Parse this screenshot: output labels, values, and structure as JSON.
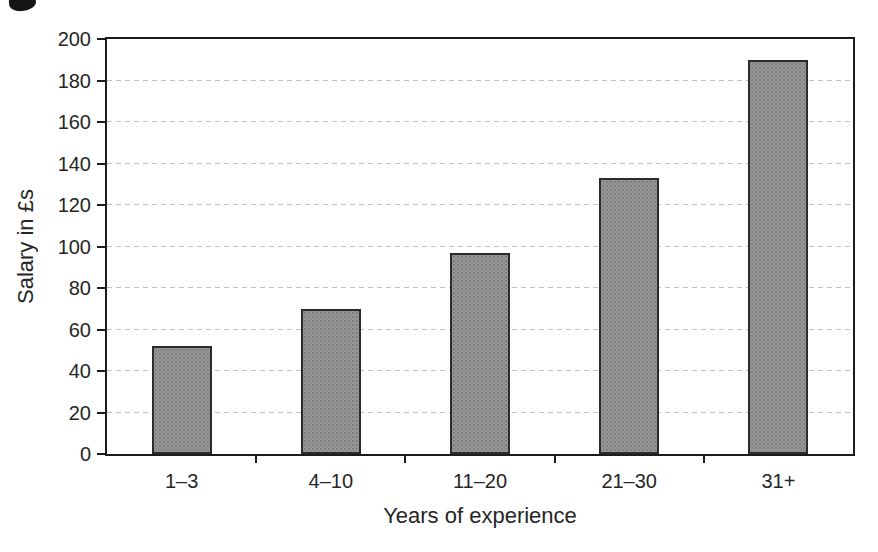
{
  "chart_data": {
    "type": "bar",
    "title": "",
    "xlabel": "Years of experience",
    "ylabel": "Salary in £s",
    "categories": [
      "1–3",
      "4–10",
      "11–20",
      "21–30",
      "31+"
    ],
    "values": [
      52,
      70,
      97,
      133,
      190
    ],
    "ylim": [
      0,
      200
    ],
    "yticks": [
      0,
      20,
      40,
      60,
      80,
      100,
      120,
      140,
      160,
      180,
      200
    ],
    "grid": "horizontal-dashed",
    "legend_position": "none",
    "colors": {
      "bar_fill": "#989898",
      "bar_border": "#2b2b2b",
      "axis": "#1c1c1c",
      "gridline": "#c3c3c3",
      "text": "#262626",
      "background": "#ffffff"
    }
  }
}
